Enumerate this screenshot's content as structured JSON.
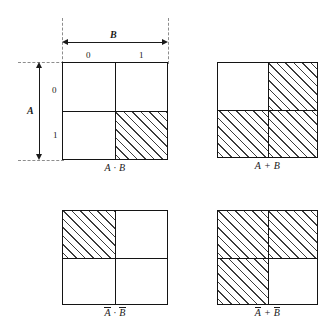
{
  "figure": {
    "type": "boolean-operation-square-diagrams",
    "variables": [
      "A",
      "B"
    ],
    "axis_values": [
      "0",
      "1"
    ],
    "hatch_meaning": "region where expression is true",
    "colors": {
      "background": "#ffffff",
      "stroke": "#141414",
      "hatch": "#3c3c3c",
      "dashed_guide": "#8d8d8d"
    }
  },
  "dimensions": {
    "horizontal": {
      "label": "B",
      "values": [
        "0",
        "1"
      ]
    },
    "vertical": {
      "label": "A",
      "values": [
        "0",
        "1"
      ]
    }
  },
  "diagrams": [
    {
      "id": "and",
      "caption_plain": "A · B",
      "caption_parts": [
        {
          "text": "A",
          "overbar": false
        },
        {
          "text": " · ",
          "overbar": false
        },
        {
          "text": "B",
          "overbar": false
        }
      ],
      "cells": {
        "top_left": {
          "a": "0",
          "b": "0",
          "filled": false
        },
        "top_right": {
          "a": "0",
          "b": "1",
          "filled": false
        },
        "bottom_left": {
          "a": "1",
          "b": "0",
          "filled": false
        },
        "bottom_right": {
          "a": "1",
          "b": "1",
          "filled": true
        }
      },
      "has_dimension_annotations": true
    },
    {
      "id": "or",
      "caption_plain": "A + B",
      "caption_parts": [
        {
          "text": "A",
          "overbar": false
        },
        {
          "text": " + ",
          "overbar": false
        },
        {
          "text": "B",
          "overbar": false
        }
      ],
      "cells": {
        "top_left": {
          "a": "0",
          "b": "0",
          "filled": false
        },
        "top_right": {
          "a": "0",
          "b": "1",
          "filled": true
        },
        "bottom_left": {
          "a": "1",
          "b": "0",
          "filled": true
        },
        "bottom_right": {
          "a": "1",
          "b": "1",
          "filled": true
        }
      },
      "has_dimension_annotations": false
    },
    {
      "id": "nor",
      "caption_plain": "A̅ · B̅",
      "caption_parts": [
        {
          "text": "A",
          "overbar": true
        },
        {
          "text": " · ",
          "overbar": false
        },
        {
          "text": "B",
          "overbar": true
        }
      ],
      "cells": {
        "top_left": {
          "a": "0",
          "b": "0",
          "filled": true
        },
        "top_right": {
          "a": "0",
          "b": "1",
          "filled": false
        },
        "bottom_left": {
          "a": "1",
          "b": "0",
          "filled": false
        },
        "bottom_right": {
          "a": "1",
          "b": "1",
          "filled": false
        }
      },
      "has_dimension_annotations": false
    },
    {
      "id": "nand",
      "caption_plain": "A̅ + B̅",
      "caption_parts": [
        {
          "text": "A",
          "overbar": true
        },
        {
          "text": " + ",
          "overbar": false
        },
        {
          "text": "B",
          "overbar": true
        }
      ],
      "cells": {
        "top_left": {
          "a": "0",
          "b": "0",
          "filled": true
        },
        "top_right": {
          "a": "0",
          "b": "1",
          "filled": true
        },
        "bottom_left": {
          "a": "1",
          "b": "0",
          "filled": true
        },
        "bottom_right": {
          "a": "1",
          "b": "1",
          "filled": false
        }
      },
      "has_dimension_annotations": false
    }
  ]
}
